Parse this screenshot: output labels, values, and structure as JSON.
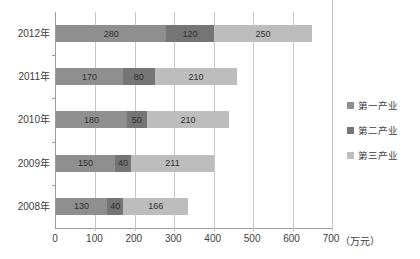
{
  "chart_data": {
    "type": "bar",
    "orientation": "horizontal",
    "stacked": true,
    "title": "",
    "categories": [
      "2012年",
      "2011年",
      "2010年",
      "2009年",
      "2008年"
    ],
    "series": [
      {
        "name": "第一产业",
        "color": "#8f8f8f",
        "values": [
          280,
          170,
          180,
          150,
          130
        ]
      },
      {
        "name": "第二产业",
        "color": "#757575",
        "values": [
          120,
          80,
          50,
          40,
          40
        ]
      },
      {
        "name": "第三产业",
        "color": "#bdbdbd",
        "values": [
          250,
          210,
          210,
          211,
          166
        ]
      }
    ],
    "x_ticks": [
      0,
      100,
      200,
      300,
      400,
      500,
      600,
      700
    ],
    "xlim": [
      0,
      700
    ],
    "unit_label": "（万元）",
    "grid": true,
    "legend_position": "right",
    "colors": {
      "gridline": "#c6c6c6",
      "axis": "#9a9a9a",
      "text": "#3d3d3d",
      "bar_label": "#2e2e2e"
    }
  }
}
